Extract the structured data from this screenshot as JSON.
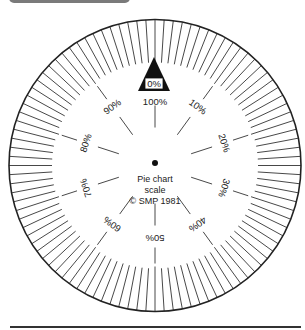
{
  "title": "Pie chart scale",
  "caption_lines": [
    "Pie chart",
    "scale",
    "© SMP 1981"
  ],
  "zero_marker": "0%",
  "tick_count": 100,
  "major_every": 10,
  "labels": [
    "100%",
    "10%",
    "20%",
    "30%",
    "40%",
    "50%",
    "60%",
    "70%",
    "80%",
    "90%"
  ],
  "colors": {
    "ink": "#222222",
    "header_bar": "#7a7a7a",
    "background": "#ffffff"
  }
}
